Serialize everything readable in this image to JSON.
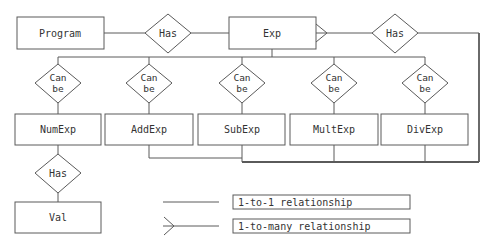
{
  "diagram": {
    "type": "entity-relationship",
    "entities": {
      "program": "Program",
      "exp": "Exp",
      "numexp": "NumExp",
      "addexp": "AddExp",
      "subexp": "SubExp",
      "multexp": "MultExp",
      "divexp": "DivExp",
      "val": "Val"
    },
    "relationships": {
      "program_has_exp": "Has",
      "exp_has_exp": "Has",
      "numexp_has_val": "Has",
      "can_be": [
        "Can",
        "be"
      ]
    },
    "legend": {
      "one_to_one": "1-to-1 relationship",
      "one_to_many": "1-to-many relationship"
    },
    "colors": {
      "stroke": "#555555",
      "text": "#333333",
      "background": "#ffffff"
    }
  }
}
